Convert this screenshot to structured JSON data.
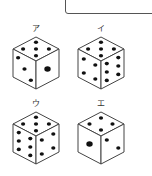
{
  "answer_box": {
    "value": ""
  },
  "dice": [
    {
      "label": "ア",
      "top": 5,
      "left": 3,
      "right": 1
    },
    {
      "label": "イ",
      "top": 5,
      "left": 4,
      "right": 6
    },
    {
      "label": "ウ",
      "top": 5,
      "left": 6,
      "right": 4
    },
    {
      "label": "エ",
      "top": 4,
      "left": 1,
      "right": 2
    }
  ],
  "colors": {
    "line": "#444444",
    "pip": "#111111",
    "face": "#ffffff"
  }
}
